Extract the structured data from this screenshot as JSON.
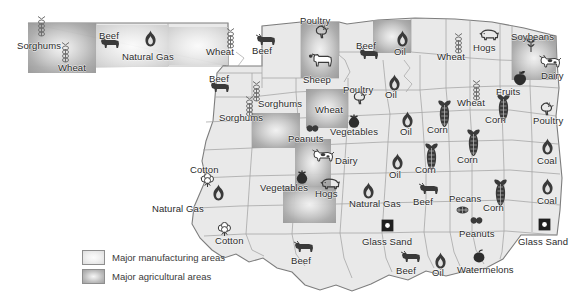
{
  "map": {
    "title": "Oklahoma Resources Map",
    "background_color": "#ffffff",
    "land_fill": "#e9e9e9",
    "border_color": "#8a8a8a",
    "county_line_color": "#9b9b9b",
    "label_color": "#2a2a2a"
  },
  "legend": {
    "items": [
      {
        "swatch": "manufacturing-swatch",
        "label": "Major manufacturing areas",
        "color": "#e6e6e6"
      },
      {
        "swatch": "agricultural-swatch",
        "label": "Major agricultural areas",
        "color": "#bdbdbd"
      }
    ]
  },
  "patches": [
    {
      "kind": "agricultural",
      "x": 28,
      "y": 23,
      "w": 68,
      "h": 50
    },
    {
      "kind": "manufacturing",
      "x": 96,
      "y": 25,
      "w": 72,
      "h": 42
    },
    {
      "kind": "manufacturing",
      "x": 168,
      "y": 27,
      "w": 60,
      "h": 38
    },
    {
      "kind": "agricultural",
      "x": 301,
      "y": 22,
      "w": 38,
      "h": 56
    },
    {
      "kind": "agricultural",
      "x": 373,
      "y": 20,
      "w": 38,
      "h": 33
    },
    {
      "kind": "agricultural",
      "x": 512,
      "y": 36,
      "w": 44,
      "h": 44
    },
    {
      "kind": "agricultural",
      "x": 306,
      "y": 89,
      "w": 42,
      "h": 39
    },
    {
      "kind": "agricultural",
      "x": 252,
      "y": 113,
      "w": 48,
      "h": 35
    },
    {
      "kind": "agricultural",
      "x": 295,
      "y": 139,
      "w": 36,
      "h": 48
    },
    {
      "kind": "agricultural",
      "x": 283,
      "y": 186,
      "w": 53,
      "h": 37
    }
  ],
  "labels": [
    {
      "text": "Sorghums",
      "x": 17,
      "y": 41,
      "icon": "wheat-icon"
    },
    {
      "text": "Wheat",
      "x": 58,
      "y": 63,
      "icon": "wheat-icon"
    },
    {
      "text": "Beef",
      "x": 99,
      "y": 31,
      "icon": "cow-icon"
    },
    {
      "text": "Natural Gas",
      "x": 122,
      "y": 52,
      "icon": "flame-icon"
    },
    {
      "text": "Wheat",
      "x": 206,
      "y": 47,
      "icon": "wheat-icon"
    },
    {
      "text": "Beef",
      "x": 252,
      "y": 46,
      "icon": "cow-icon"
    },
    {
      "text": "Beef",
      "x": 209,
      "y": 74,
      "icon": "cow-icon"
    },
    {
      "text": "Poultry",
      "x": 300,
      "y": 16,
      "icon": "chicken-icon"
    },
    {
      "text": "Sheep",
      "x": 303,
      "y": 75,
      "icon": "sheep-icon"
    },
    {
      "text": "Sorghums",
      "x": 219,
      "y": 113,
      "icon": "wheat-icon"
    },
    {
      "text": "Sorghums",
      "x": 258,
      "y": 99,
      "icon": "wheat-icon"
    },
    {
      "text": "Poultry",
      "x": 343,
      "y": 85,
      "icon": "chicken-icon"
    },
    {
      "text": "Wheat",
      "x": 315,
      "y": 105,
      "icon": "wheat-icon"
    },
    {
      "text": "Vegetables",
      "x": 330,
      "y": 127,
      "icon": "tomato-icon"
    },
    {
      "text": "Beef",
      "x": 356,
      "y": 41,
      "icon": "cow-icon"
    },
    {
      "text": "Oil",
      "x": 394,
      "y": 47,
      "icon": "oildrop-icon"
    },
    {
      "text": "Oil",
      "x": 385,
      "y": 90,
      "icon": "oildrop-icon"
    },
    {
      "text": "Oil",
      "x": 400,
      "y": 127,
      "icon": "oildrop-icon"
    },
    {
      "text": "Oil",
      "x": 389,
      "y": 170,
      "icon": "oildrop-icon"
    },
    {
      "text": "Wheat",
      "x": 437,
      "y": 52,
      "icon": "wheat-icon"
    },
    {
      "text": "Hogs",
      "x": 473,
      "y": 43,
      "icon": "pig-icon"
    },
    {
      "text": "Soybeans",
      "x": 511,
      "y": 32,
      "icon": "soy-icon"
    },
    {
      "text": "Dairy",
      "x": 541,
      "y": 71,
      "icon": "dairycow-icon"
    },
    {
      "text": "Fruits",
      "x": 496,
      "y": 87,
      "icon": "fruit-icon"
    },
    {
      "text": "Wheat",
      "x": 457,
      "y": 98,
      "icon": "wheat-icon"
    },
    {
      "text": "Poultry",
      "x": 533,
      "y": 116,
      "icon": "chicken-icon"
    },
    {
      "text": "Corn",
      "x": 427,
      "y": 125,
      "icon": "corn-icon"
    },
    {
      "text": "Corn",
      "x": 485,
      "y": 115,
      "icon": "corn-icon"
    },
    {
      "text": "Corn",
      "x": 415,
      "y": 165,
      "icon": "corn-icon"
    },
    {
      "text": "Corn",
      "x": 457,
      "y": 155,
      "icon": "corn-icon"
    },
    {
      "text": "Corn",
      "x": 483,
      "y": 203,
      "icon": "corn-icon"
    },
    {
      "text": "Coal",
      "x": 537,
      "y": 156,
      "icon": "oildrop-icon"
    },
    {
      "text": "Coal",
      "x": 537,
      "y": 196,
      "icon": "oildrop-icon"
    },
    {
      "text": "Peanuts",
      "x": 288,
      "y": 134,
      "icon": "peanut-icon"
    },
    {
      "text": "Dairy",
      "x": 335,
      "y": 156,
      "icon": "dairycow-icon"
    },
    {
      "text": "Vegetables",
      "x": 260,
      "y": 183,
      "icon": "tomato-icon"
    },
    {
      "text": "Hogs",
      "x": 315,
      "y": 189,
      "icon": "pig-icon"
    },
    {
      "text": "Cotton",
      "x": 190,
      "y": 165,
      "icon": "cotton-icon"
    },
    {
      "text": "Cotton",
      "x": 215,
      "y": 236,
      "icon": "cotton-icon"
    },
    {
      "text": "Natural Gas",
      "x": 152,
      "y": 204,
      "icon": "flame-icon"
    },
    {
      "text": "Natural Gas",
      "x": 349,
      "y": 199,
      "icon": "flame-icon"
    },
    {
      "text": "Beef",
      "x": 291,
      "y": 256,
      "icon": "cow-icon"
    },
    {
      "text": "Beef",
      "x": 413,
      "y": 197,
      "icon": "cow-icon"
    },
    {
      "text": "Beef",
      "x": 396,
      "y": 266,
      "icon": "cow-icon"
    },
    {
      "text": "Glass Sand",
      "x": 362,
      "y": 237,
      "icon": "glasssand-icon"
    },
    {
      "text": "Glass Sand",
      "x": 518,
      "y": 237,
      "icon": "glasssand-icon"
    },
    {
      "text": "Pecans",
      "x": 449,
      "y": 194,
      "icon": "pecan-icon"
    },
    {
      "text": "Peanuts",
      "x": 459,
      "y": 229,
      "icon": "peanut-icon"
    },
    {
      "text": "Watermelons",
      "x": 457,
      "y": 265,
      "icon": "watermelon-icon"
    },
    {
      "text": "Oil",
      "x": 432,
      "y": 268,
      "icon": "oildrop-icon"
    }
  ],
  "icons": [
    {
      "name": "wheat-icon",
      "x": 35,
      "y": 16
    },
    {
      "name": "wheat-icon",
      "x": 59,
      "y": 42
    },
    {
      "name": "cow-icon",
      "x": 99,
      "y": 36
    },
    {
      "name": "flame-icon",
      "x": 144,
      "y": 30
    },
    {
      "name": "wheat-icon",
      "x": 224,
      "y": 28
    },
    {
      "name": "cow-icon",
      "x": 255,
      "y": 33
    },
    {
      "name": "cow-icon",
      "x": 209,
      "y": 80
    },
    {
      "name": "chicken-icon",
      "x": 313,
      "y": 25
    },
    {
      "name": "sheep-icon",
      "x": 308,
      "y": 52
    },
    {
      "name": "wheat-icon",
      "x": 250,
      "y": 81
    },
    {
      "name": "wheat-icon",
      "x": 243,
      "y": 96
    },
    {
      "name": "chicken-icon",
      "x": 351,
      "y": 91
    },
    {
      "name": "tomato-icon",
      "x": 346,
      "y": 114
    },
    {
      "name": "cow-icon",
      "x": 358,
      "y": 47
    },
    {
      "name": "oildrop-icon",
      "x": 396,
      "y": 30
    },
    {
      "name": "oildrop-icon",
      "x": 388,
      "y": 74
    },
    {
      "name": "oildrop-icon",
      "x": 401,
      "y": 111
    },
    {
      "name": "oildrop-icon",
      "x": 391,
      "y": 153
    },
    {
      "name": "wheat-icon",
      "x": 452,
      "y": 33
    },
    {
      "name": "pig-icon",
      "x": 479,
      "y": 29
    },
    {
      "name": "soy-icon",
      "x": 524,
      "y": 37
    },
    {
      "name": "dairycow-icon",
      "x": 538,
      "y": 54
    },
    {
      "name": "fruit-icon",
      "x": 512,
      "y": 70
    },
    {
      "name": "wheat-icon",
      "x": 470,
      "y": 80
    },
    {
      "name": "chicken-icon",
      "x": 538,
      "y": 102
    },
    {
      "name": "corn-icon",
      "x": 437,
      "y": 100
    },
    {
      "name": "corn-icon",
      "x": 496,
      "y": 94
    },
    {
      "name": "corn-icon",
      "x": 424,
      "y": 143
    },
    {
      "name": "corn-icon",
      "x": 466,
      "y": 129
    },
    {
      "name": "corn-icon",
      "x": 493,
      "y": 179
    },
    {
      "name": "oildrop-icon",
      "x": 541,
      "y": 138
    },
    {
      "name": "oildrop-icon",
      "x": 541,
      "y": 178
    },
    {
      "name": "peanut-icon",
      "x": 305,
      "y": 124
    },
    {
      "name": "dairycow-icon",
      "x": 311,
      "y": 148
    },
    {
      "name": "tomato-icon",
      "x": 294,
      "y": 170
    },
    {
      "name": "pig-icon",
      "x": 320,
      "y": 178
    },
    {
      "name": "cotton-icon",
      "x": 199,
      "y": 173
    },
    {
      "name": "cotton-icon",
      "x": 216,
      "y": 222
    },
    {
      "name": "flame-icon",
      "x": 212,
      "y": 184
    },
    {
      "name": "flame-icon",
      "x": 362,
      "y": 182
    },
    {
      "name": "cow-icon",
      "x": 293,
      "y": 240
    },
    {
      "name": "cow-icon",
      "x": 418,
      "y": 182
    },
    {
      "name": "cow-icon",
      "x": 400,
      "y": 250
    },
    {
      "name": "glasssand-icon",
      "x": 381,
      "y": 219
    },
    {
      "name": "glasssand-icon",
      "x": 538,
      "y": 218
    },
    {
      "name": "pecan-icon",
      "x": 455,
      "y": 205
    },
    {
      "name": "peanut-icon",
      "x": 469,
      "y": 216
    },
    {
      "name": "watermelon-icon",
      "x": 471,
      "y": 249
    },
    {
      "name": "oildrop-icon",
      "x": 434,
      "y": 252
    }
  ]
}
